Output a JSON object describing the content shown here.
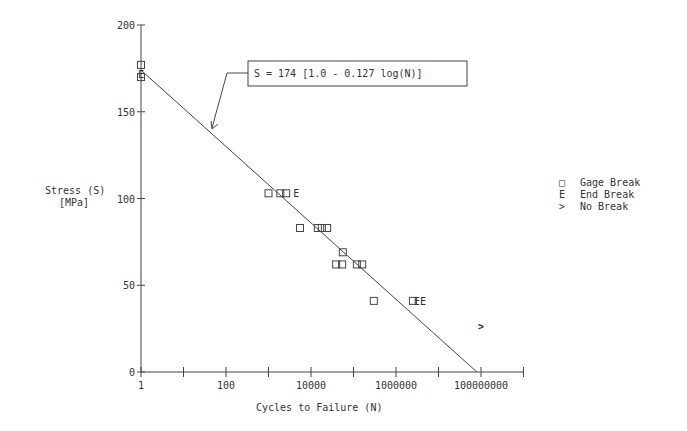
{
  "chart_data": {
    "type": "scatter",
    "title": "",
    "xlabel": "Cycles to Failure  (N)",
    "ylabel": "Stress  (S)",
    "ylabel_units": "[MPa]",
    "xscale": "log",
    "xlim": [
      1,
      1000000000
    ],
    "ylim": [
      0,
      200
    ],
    "x_tick_labels": [
      "1",
      "100",
      "10000",
      "1000000",
      "100000000"
    ],
    "y_tick_labels": [
      "0",
      "50",
      "100",
      "150",
      "200"
    ],
    "grid": false,
    "legend_position": "right",
    "annotation": "S = 174 [1.0 - 0.127 log(N)]",
    "fit_line": {
      "S0": 174,
      "b": 0.127,
      "N_start": 1,
      "N_end": 80000000
    },
    "series": [
      {
        "name": "Gage Break",
        "symbol": "square",
        "points": [
          [
            1,
            177
          ],
          [
            1,
            170
          ],
          [
            1000,
            103
          ],
          [
            1900,
            103
          ],
          [
            2600,
            103
          ],
          [
            5500,
            83
          ],
          [
            14500,
            83
          ],
          [
            18000,
            83
          ],
          [
            24000,
            83
          ],
          [
            56000,
            69
          ],
          [
            39000,
            62
          ],
          [
            54000,
            62
          ],
          [
            120000,
            62
          ],
          [
            160000,
            62
          ],
          [
            300000,
            41
          ],
          [
            2500000,
            41
          ]
        ]
      },
      {
        "name": "End Break",
        "symbol": "E",
        "points": [
          [
            1,
            172
          ],
          [
            4500,
            103
          ],
          [
            3100000,
            41
          ],
          [
            4300000,
            41
          ]
        ]
      },
      {
        "name": "No Break",
        "symbol": ">",
        "points": [
          [
            100000000,
            26.5
          ]
        ]
      }
    ]
  },
  "legend": {
    "items": [
      {
        "symbol": "□",
        "label": "Gage Break"
      },
      {
        "symbol": "E",
        "label": "End Break"
      },
      {
        "symbol": ">",
        "label": "No Break"
      }
    ]
  }
}
